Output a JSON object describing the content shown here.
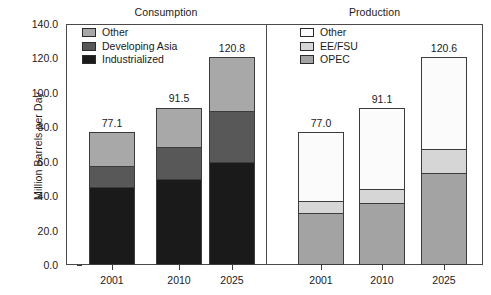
{
  "chart_data": {
    "type": "bar",
    "subtype": "stacked-bar",
    "title": "",
    "xlabel": "",
    "ylabel": "Million Barrels per Day",
    "ylim": [
      0.0,
      140.0
    ],
    "yticks": [
      "0.0",
      "20.0",
      "40.0",
      "60.0",
      "80.0",
      "100.0",
      "120.0",
      "140.0"
    ],
    "ytick_values": [
      0,
      20,
      40,
      60,
      80,
      100,
      120,
      140
    ],
    "grid": false,
    "legend_position": "inside-top-left of each panel",
    "panels": [
      {
        "name": "consumption",
        "title": "Consumption",
        "categories": [
          "2001",
          "2010",
          "2025"
        ],
        "series": [
          {
            "name": "Industrialized",
            "color": "#1a1a1a",
            "values": [
              45.5,
              50.2,
              60.1
            ]
          },
          {
            "name": "Developing Asia",
            "color": "#585858",
            "values": [
              12.3,
              18.6,
              29.8
            ]
          },
          {
            "name": "Other",
            "color": "#a8a8a8",
            "values": [
              19.3,
              22.7,
              30.9
            ]
          }
        ],
        "totals": [
          "77.1",
          "91.5",
          "120.8"
        ],
        "total_values": [
          77.1,
          91.5,
          120.8
        ]
      },
      {
        "name": "production",
        "title": "Production",
        "categories": [
          "2001",
          "2010",
          "2025"
        ],
        "series": [
          {
            "name": "OPEC",
            "color": "#a3a3a3",
            "values": [
              29.8,
              35.6,
              53.1
            ]
          },
          {
            "name": "EE/FSU",
            "color": "#d6d6d6",
            "values": [
              7.5,
              8.7,
              14.6
            ]
          },
          {
            "name": "Other",
            "color": "#fbfbfb",
            "values": [
              39.7,
              46.8,
              52.9
            ]
          }
        ],
        "totals": [
          "77.0",
          "91.1",
          "120.6"
        ],
        "total_values": [
          77.0,
          91.1,
          120.6
        ]
      }
    ]
  },
  "axis": {
    "y_title": "Million Barrels per Day"
  }
}
